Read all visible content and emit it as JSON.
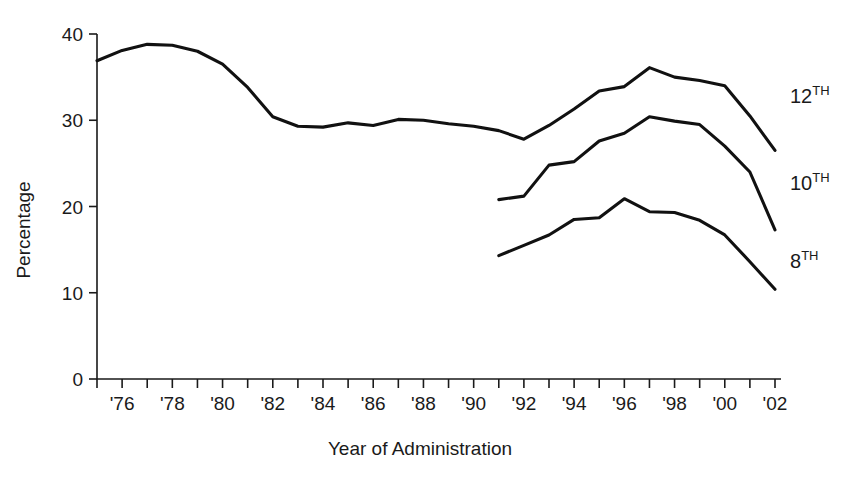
{
  "chart_data": {
    "type": "line",
    "title": "",
    "xlabel": "Year of Administration",
    "ylabel": "Percentage",
    "ylim": [
      0,
      40
    ],
    "yticks": [
      0,
      10,
      20,
      30,
      40
    ],
    "ytick_labels": [
      "0",
      "10",
      "20",
      "30",
      "40"
    ],
    "xlim": [
      1975,
      2002
    ],
    "xticks": [
      1975,
      1976,
      1977,
      1978,
      1979,
      1980,
      1981,
      1982,
      1983,
      1984,
      1985,
      1986,
      1987,
      1988,
      1989,
      1990,
      1991,
      1992,
      1993,
      1994,
      1995,
      1996,
      1997,
      1998,
      1999,
      2000,
      2001,
      2002
    ],
    "xtick_labels": [
      "",
      "'76",
      "",
      "'78",
      "",
      "'80",
      "",
      "'82",
      "",
      "'84",
      "",
      "'86",
      "",
      "'88",
      "",
      "'90",
      "",
      "'92",
      "",
      "'94",
      "",
      "'96",
      "",
      "'98",
      "",
      "'00",
      "",
      "'02"
    ],
    "grid": false,
    "legend_position": "right-inline",
    "line_color": "#111111",
    "series": [
      {
        "name": "12TH",
        "label_base": "12",
        "label_sup": "TH",
        "x": [
          1975,
          1976,
          1977,
          1978,
          1979,
          1980,
          1981,
          1982,
          1983,
          1984,
          1985,
          1986,
          1987,
          1988,
          1989,
          1990,
          1991,
          1992,
          1993,
          1994,
          1995,
          1996,
          1997,
          1998,
          1999,
          2000,
          2001,
          2002
        ],
        "values": [
          36.9,
          38.1,
          38.8,
          38.7,
          38.0,
          36.5,
          33.8,
          30.4,
          29.3,
          29.2,
          29.7,
          29.4,
          30.1,
          30.0,
          29.6,
          29.3,
          28.8,
          27.8,
          29.4,
          31.3,
          33.4,
          33.9,
          36.1,
          35.0,
          34.6,
          34.0,
          30.5,
          26.5
        ]
      },
      {
        "name": "10TH",
        "label_base": "10",
        "label_sup": "TH",
        "x": [
          1991,
          1992,
          1993,
          1994,
          1995,
          1996,
          1997,
          1998,
          1999,
          2000,
          2001,
          2002
        ],
        "values": [
          20.8,
          21.2,
          24.8,
          25.2,
          27.6,
          28.5,
          30.4,
          29.9,
          29.5,
          27.0,
          24.0,
          17.3
        ]
      },
      {
        "name": "8TH",
        "label_base": "8",
        "label_sup": "TH",
        "x": [
          1991,
          1992,
          1993,
          1994,
          1995,
          1996,
          1997,
          1998,
          1999,
          2000,
          2001,
          2002
        ],
        "values": [
          14.3,
          15.5,
          16.7,
          18.5,
          18.7,
          20.9,
          19.4,
          19.3,
          18.4,
          16.7,
          13.6,
          10.4
        ]
      }
    ]
  },
  "axis": {
    "y_title": "Percentage",
    "x_title": "Year of Administration"
  }
}
